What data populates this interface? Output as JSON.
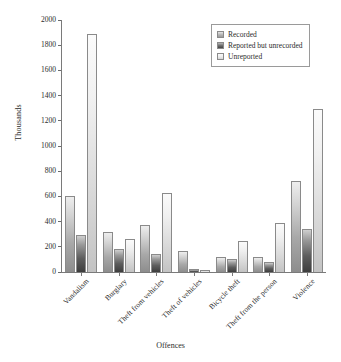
{
  "chart_data": {
    "type": "bar",
    "title": "",
    "xlabel": "Offences",
    "ylabel": "Thousands",
    "ylim": [
      0,
      2000
    ],
    "ytick_step": 200,
    "yticks": [
      0,
      200,
      400,
      600,
      800,
      1000,
      1200,
      1400,
      1600,
      1800,
      2000
    ],
    "grid": false,
    "legend_position": "top-right",
    "categories": [
      "Vandalism",
      "Burglary",
      "Theft from vehicles",
      "Theft of vehicles",
      "Bicycle theft",
      "Theft from the person",
      "Violence"
    ],
    "series": [
      {
        "name": "Recorded",
        "color": "#b4b4b4",
        "values": [
          600,
          320,
          375,
          165,
          120,
          120,
          720
        ]
      },
      {
        "name": "Reported but unrecorded",
        "color": "#5d5d5d",
        "values": [
          290,
          180,
          140,
          20,
          100,
          80,
          340
        ]
      },
      {
        "name": "Unreported",
        "color": "#e6e6e6",
        "values": [
          1890,
          265,
          630,
          15,
          245,
          390,
          1295
        ]
      }
    ]
  },
  "axes": {
    "y_title": "Thousands",
    "x_title": "Offences"
  },
  "legend": {
    "items": [
      {
        "label": "Recorded"
      },
      {
        "label": "Reported but unrecorded"
      },
      {
        "label": "Unreported"
      }
    ]
  },
  "colors": {
    "axis": "#7a7a7a",
    "text": "#2b2b2b",
    "background": "#ffffff",
    "bar_border": "#8a8a8a"
  }
}
